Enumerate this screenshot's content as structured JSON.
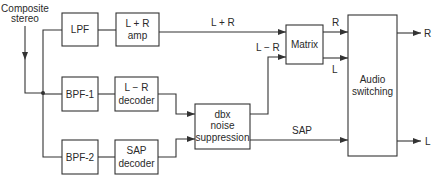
{
  "diagram": {
    "input_label": {
      "line1": "Composite",
      "line2": "stereo"
    },
    "blocks": {
      "lpf": {
        "line1": "LPF"
      },
      "lr_sum_amp": {
        "line1": "L + R",
        "line2": "amp"
      },
      "bpf1": {
        "line1": "BPF-1"
      },
      "lr_diff_decoder": {
        "line1": "L − R",
        "line2": "decoder"
      },
      "bpf2": {
        "line1": "BPF-2"
      },
      "sap_decoder": {
        "line1": "SAP",
        "line2": "decoder"
      },
      "dbx": {
        "line1": "dbx",
        "line2": "noise",
        "line3": "suppression"
      },
      "matrix": {
        "line1": "Matrix"
      },
      "audio_switching": {
        "line1": "Audio",
        "line2": "switching"
      }
    },
    "signals": {
      "lr_sum": "L + R",
      "lr_diff": "L − R",
      "matrix_r": "R",
      "matrix_l": "L",
      "sap": "SAP",
      "out_r": "R",
      "out_l": "L"
    },
    "colors": {
      "line": "#333333",
      "text": "#2a2a2a",
      "background": "#ffffff"
    }
  }
}
